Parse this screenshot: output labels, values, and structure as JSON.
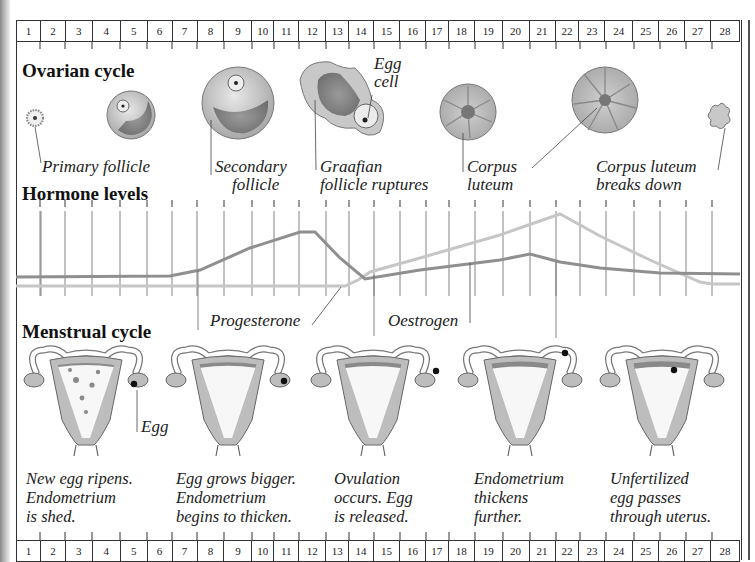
{
  "days": [
    "1",
    "2",
    "3",
    "4",
    "5",
    "6",
    "7",
    "8",
    "9",
    "10",
    "11",
    "12",
    "13",
    "14",
    "15",
    "16",
    "17",
    "18",
    "19",
    "20",
    "21",
    "22",
    "23",
    "24",
    "25",
    "26",
    "27",
    "28"
  ],
  "day_boundaries": [
    16,
    40,
    65,
    92,
    120,
    147,
    172,
    197,
    224,
    252,
    274,
    299,
    326,
    349,
    374,
    400,
    426,
    449,
    475,
    503,
    530,
    556,
    580,
    606,
    634,
    660,
    686,
    712,
    740
  ],
  "sections": {
    "ovarian": "Ovarian cycle",
    "hormone": "Hormone levels",
    "menstrual": "Menstrual cycle"
  },
  "ovarian_labels": {
    "primary": "Primary follicle",
    "secondary": "Secondary\n    follicle",
    "egg_cell": "Egg\ncell",
    "graafian": "Graafian\nfollicle ruptures",
    "corpus": "Corpus\nluteum",
    "corpus_breaks": "Corpus luteum\nbreaks down"
  },
  "hormone_labels": {
    "progesterone": "Progesterone",
    "oestrogen": "Oestrogen"
  },
  "menstrual_labels": {
    "egg": "Egg"
  },
  "captions": [
    "New egg ripens.\nEndometrium\nis shed.",
    "Egg grows bigger.\nEndometrium\nbegins to thicken.",
    "Ovulation\noccurs. Egg\nis released.",
    "Endometrium\nthickens\nfurther.",
    "Unfertilized\negg passes\nthrough uterus."
  ],
  "colors": {
    "oestrogen_line": "#8f8f8f",
    "progesterone_line": "#c4c4c4",
    "tissue": "#bdbdbd",
    "tissue_dark": "#8a8a8a",
    "outline": "#555555"
  }
}
